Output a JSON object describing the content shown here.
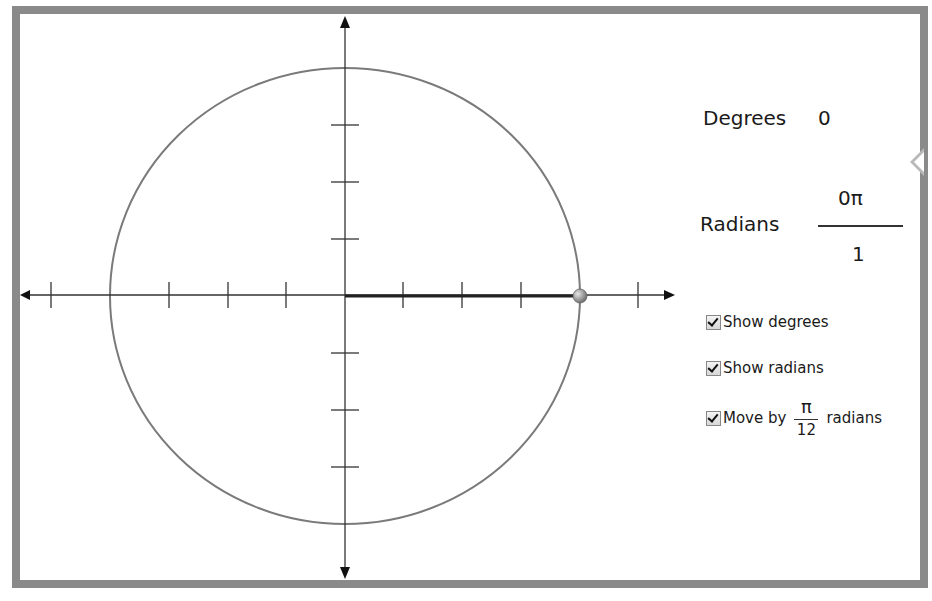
{
  "readout": {
    "degrees_label": "Degrees",
    "degrees_value": "0",
    "radians_label": "Radians",
    "radians_numerator": "0π",
    "radians_denominator": "1"
  },
  "options": {
    "show_degrees": {
      "label": "Show degrees",
      "checked": true
    },
    "show_radians": {
      "label": "Show radians",
      "checked": true
    },
    "move_by": {
      "label_prefix": "Move by",
      "numerator": "π",
      "denominator": "12",
      "label_suffix": "radians",
      "checked": true
    }
  },
  "unit_circle": {
    "angle_degrees": 0,
    "angle_radians": "0π/1",
    "point_color": "#9a9a9a",
    "circle_color": "#7a7a7a",
    "radius_line_color": "#222222"
  },
  "frame": {
    "border_color": "#8a8a8a"
  }
}
